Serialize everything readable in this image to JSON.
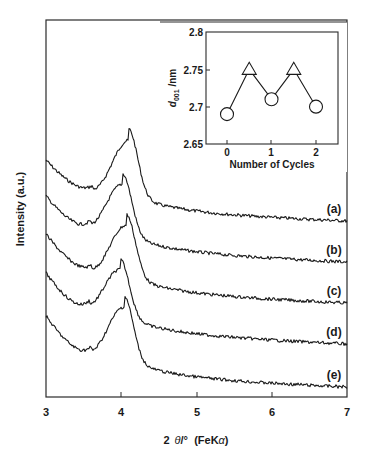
{
  "chart_data": [
    {
      "id": "main",
      "type": "line",
      "title": "",
      "xlabel": "2 θ/° (FeKα)",
      "ylabel": "Intensity (a.u.)",
      "xlim": [
        3,
        7
      ],
      "xticks": [
        "3",
        "4",
        "5",
        "6",
        "7"
      ],
      "yticks": [],
      "grid": false,
      "legend": "inline labels at right",
      "series": [
        {
          "name": "(a)",
          "peak_2theta": 4.1,
          "start_px_y": 160,
          "min_px_y": 192,
          "peak_px_y": 134,
          "end_px_y": 221
        },
        {
          "name": "(b)",
          "peak_2theta": 4.02,
          "start_px_y": 196,
          "min_px_y": 230,
          "peak_px_y": 177,
          "end_px_y": 262
        },
        {
          "name": "(c)",
          "peak_2theta": 4.07,
          "start_px_y": 234,
          "min_px_y": 272,
          "peak_px_y": 218,
          "end_px_y": 303
        },
        {
          "name": "(d)",
          "peak_2theta": 3.99,
          "start_px_y": 273,
          "min_px_y": 311,
          "peak_px_y": 262,
          "end_px_y": 344
        },
        {
          "name": "(e)",
          "peak_2theta": 4.04,
          "start_px_y": 316,
          "min_px_y": 356,
          "peak_px_y": 300,
          "end_px_y": 387
        }
      ]
    },
    {
      "id": "inset",
      "type": "line",
      "title": "",
      "xlabel": "Number of Cycles",
      "ylabel": "d001 /nm",
      "ylabel_main": "d",
      "ylabel_sub": "001",
      "ylabel_unit": " /nm",
      "xlim": [
        -0.4,
        2.5
      ],
      "ylim": [
        2.65,
        2.8
      ],
      "xticks": [
        "0",
        "1",
        "2"
      ],
      "yticks": [
        "2.65",
        "2.7",
        "2.75",
        "2.8"
      ],
      "grid": false,
      "x": [
        0,
        0.5,
        1,
        1.5,
        2
      ],
      "values": [
        2.69,
        2.75,
        2.71,
        2.75,
        2.7
      ],
      "markers": [
        "circle",
        "triangle",
        "circle",
        "triangle",
        "circle"
      ]
    }
  ],
  "labels": {
    "xlabel_prefix": "2",
    "xlabel_theta": "θ",
    "xlabel_mid": "/°  (FeK",
    "xlabel_alpha": "α",
    "xlabel_end": ")",
    "ylabel": "Intensity (a.u.)",
    "inset_xlabel": "Number of Cycles",
    "inset_ylabel_d": "d",
    "inset_ylabel_sub": "001",
    "inset_ylabel_unit": " /nm",
    "xticks": [
      "3",
      "4",
      "5",
      "6",
      "7"
    ],
    "inset_xticks": [
      "0",
      "1",
      "2"
    ],
    "inset_yticks": [
      "2.8",
      "2.75",
      "2.7",
      "2.65"
    ],
    "series": [
      "(a)",
      "(b)",
      "(c)",
      "(d)",
      "(e)"
    ]
  }
}
